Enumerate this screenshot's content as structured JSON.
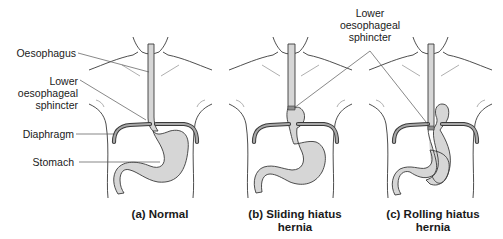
{
  "figure": {
    "panels": [
      {
        "id": "a",
        "caption_line1": "(a) Normal",
        "caption_line2": "",
        "sphincter_position": "at diaphragm"
      },
      {
        "id": "b",
        "caption_line1": "(b) Sliding hiatus",
        "caption_line2": "hernia",
        "sphincter_position": "above diaphragm"
      },
      {
        "id": "c",
        "caption_line1": "(c) Rolling hiatus",
        "caption_line2": "hernia",
        "sphincter_position": "at diaphragm"
      }
    ],
    "left_labels": {
      "oesophagus": "Oesophagus",
      "les_line1": "Lower",
      "les_line2": "oesophageal",
      "les_line3": "sphincter",
      "diaphragm": "Diaphragm",
      "stomach": "Stomach"
    },
    "top_label": {
      "line1": "Lower",
      "line2": "oesophageal",
      "line3": "sphincter"
    },
    "colors": {
      "organ_fill": "#d6d6d6",
      "outline": "#3a3a3a",
      "leader": "#555555"
    }
  }
}
